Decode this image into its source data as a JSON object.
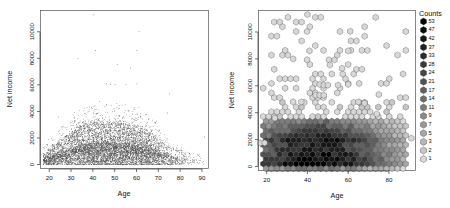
{
  "figure": {
    "background": "#ffffff",
    "panels": [
      "scatter",
      "hexbin"
    ]
  },
  "chart_data": [
    {
      "type": "scatter",
      "panel": "left",
      "title": "",
      "xlabel": "Age",
      "ylabel": "Net income",
      "xlim": [
        16,
        93
      ],
      "ylim": [
        -300,
        11600
      ],
      "xticks": [
        20,
        30,
        40,
        50,
        60,
        70,
        80,
        90
      ],
      "yticks": [
        0,
        2000,
        4000,
        6000,
        8000,
        10000
      ],
      "grid": false,
      "legend": "none",
      "point_color": "#4a4a4a",
      "point_size_px": 0.6,
      "description": "Dense overplotted scatter of Net income versus Age; values concentrated below 2000 across all ages, tapering upward to a few points near 11000. Ages are integers producing vertical striping.",
      "density_profile": {
        "x": [
          18,
          20,
          22,
          24,
          26,
          28,
          30,
          32,
          34,
          36,
          38,
          40,
          42,
          44,
          46,
          48,
          50,
          52,
          54,
          56,
          58,
          60,
          62,
          64,
          66,
          68,
          70,
          72,
          74,
          76,
          78,
          80,
          82,
          84,
          86,
          88,
          90
        ],
        "n_points": [
          120,
          150,
          165,
          170,
          180,
          200,
          225,
          250,
          265,
          280,
          300,
          310,
          305,
          300,
          295,
          300,
          305,
          300,
          295,
          290,
          285,
          280,
          270,
          250,
          225,
          195,
          160,
          120,
          95,
          75,
          60,
          45,
          32,
          20,
          14,
          9,
          5
        ],
        "median_income": [
          380,
          520,
          640,
          760,
          880,
          980,
          1080,
          1180,
          1260,
          1320,
          1380,
          1400,
          1420,
          1400,
          1380,
          1390,
          1400,
          1380,
          1360,
          1340,
          1320,
          1280,
          1220,
          1150,
          1060,
          960,
          840,
          720,
          640,
          580,
          520,
          470,
          430,
          400,
          380,
          360,
          340
        ],
        "p95_income": [
          1500,
          1900,
          2200,
          2500,
          2800,
          3000,
          3300,
          3600,
          3800,
          3950,
          4050,
          4100,
          4100,
          4050,
          4000,
          4000,
          4050,
          4000,
          3950,
          3900,
          3850,
          3800,
          3650,
          3450,
          3200,
          2900,
          2500,
          2100,
          1800,
          1550,
          1350,
          1200,
          1050,
          950,
          850,
          750,
          700
        ]
      },
      "outliers": [
        {
          "x": 40,
          "y": 11300
        },
        {
          "x": 61,
          "y": 10050
        },
        {
          "x": 33,
          "y": 8000
        },
        {
          "x": 41,
          "y": 8600
        },
        {
          "x": 60,
          "y": 8600
        },
        {
          "x": 51,
          "y": 7550
        },
        {
          "x": 57,
          "y": 7300
        },
        {
          "x": 46,
          "y": 6100
        },
        {
          "x": 48,
          "y": 6050
        },
        {
          "x": 50,
          "y": 6050
        },
        {
          "x": 55,
          "y": 6050
        },
        {
          "x": 60,
          "y": 6100
        },
        {
          "x": 24,
          "y": 3600
        },
        {
          "x": 75,
          "y": 5350
        },
        {
          "x": 74,
          "y": 3900
        },
        {
          "x": 91,
          "y": 2100
        }
      ]
    },
    {
      "type": "heatmap",
      "subtype": "hexbin",
      "panel": "right",
      "title": "",
      "xlabel": "Age",
      "ylabel": "Net income",
      "xlim": [
        16,
        93
      ],
      "ylim": [
        -300,
        11600
      ],
      "xticks": [
        20,
        40,
        60,
        80
      ],
      "yticks": [
        0,
        2000,
        4000,
        6000,
        8000,
        10000
      ],
      "grid": false,
      "legend_position": "right",
      "legend_title": "Counts",
      "legend_values": [
        53,
        47,
        42,
        37,
        33,
        28,
        24,
        21,
        17,
        14,
        11,
        9,
        7,
        5,
        3,
        2,
        1
      ],
      "legend_colors": [
        "#000000",
        "#0a0a0a",
        "#151515",
        "#202020",
        "#2b2b2b",
        "#383838",
        "#454545",
        "#525252",
        "#606060",
        "#6e6e6e",
        "#7c7c7c",
        "#8a8a8a",
        "#989898",
        "#a6a6a6",
        "#b6b6b6",
        "#c6c6c6",
        "#d8d8d8"
      ],
      "hex_outline": "#444444",
      "description": "Hexagonal binning of the same Age vs Net income data. Darkest (highest-count) hexagons sit along the 0-1500 income band between ages 18 and 70; lightest single-count hexagons scatter upward to 11000.",
      "bands": [
        {
          "y_center": 250,
          "x_from": 17,
          "x_to": 86,
          "counts_peak": 53
        },
        {
          "y_center": 800,
          "x_from": 17,
          "x_to": 88,
          "counts_peak": 47
        },
        {
          "y_center": 1350,
          "x_from": 17,
          "x_to": 88,
          "counts_peak": 37
        },
        {
          "y_center": 1900,
          "x_from": 18,
          "x_to": 86,
          "counts_peak": 24
        },
        {
          "y_center": 2450,
          "x_from": 20,
          "x_to": 84,
          "counts_peak": 17
        },
        {
          "y_center": 3000,
          "x_from": 22,
          "x_to": 80,
          "counts_peak": 11
        },
        {
          "y_center": 3550,
          "x_from": 25,
          "x_to": 76,
          "counts_peak": 7
        },
        {
          "y_center": 4100,
          "x_from": 28,
          "x_to": 72,
          "counts_peak": 5
        },
        {
          "y_center": 4650,
          "x_from": 32,
          "x_to": 68,
          "counts_peak": 3
        },
        {
          "y_center": 5200,
          "x_from": 36,
          "x_to": 64,
          "counts_peak": 2
        },
        {
          "y_center": 5800,
          "x_from": 40,
          "x_to": 62,
          "counts_peak": 1
        }
      ]
    }
  ],
  "left_plot": {
    "xlabel": "Age",
    "ylabel": "Net income",
    "xticks": [
      "20",
      "30",
      "40",
      "50",
      "60",
      "70",
      "80",
      "90"
    ],
    "yticks": [
      "0",
      "2000",
      "4000",
      "6000",
      "8000",
      "10000"
    ]
  },
  "right_plot": {
    "xlabel": "Age",
    "ylabel": "Net income",
    "xticks": [
      "20",
      "40",
      "60",
      "80"
    ],
    "yticks": [
      "0",
      "2000",
      "4000",
      "6000",
      "8000",
      "10000"
    ],
    "legend": {
      "title": "Counts",
      "labels": [
        "53",
        "47",
        "42",
        "37",
        "33",
        "28",
        "24",
        "21",
        "17",
        "14",
        "11",
        "9",
        "7",
        "5",
        "3",
        "2",
        "1"
      ]
    }
  }
}
